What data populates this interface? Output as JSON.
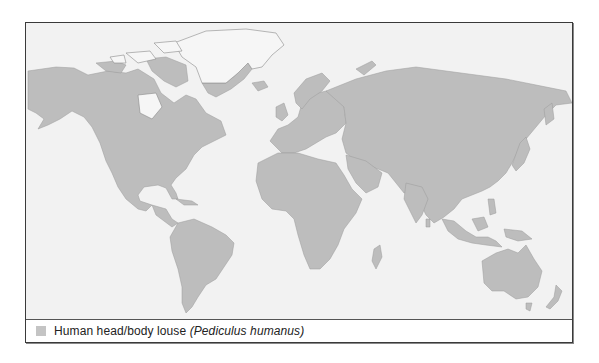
{
  "map": {
    "title": "",
    "colors": {
      "ocean": "#f2f2f2",
      "range": "#bdbdbd",
      "outside_range_land": "#f4f4f4",
      "coastline": "#8a8a8a"
    },
    "regions_shaded": [
      "North America",
      "Central America",
      "South America",
      "Europe",
      "Africa",
      "Asia",
      "Australia",
      "New Zealand",
      "Madagascar",
      "Japan",
      "Southeast Asia",
      "Iceland",
      "British Isles"
    ],
    "regions_unshaded": [
      "Greenland (interior)",
      "Canadian Arctic Archipelago"
    ]
  },
  "legend": {
    "items": [
      {
        "swatch_color": "#c4c4c4",
        "label": "Human head/body louse",
        "scientific_name": "(Pediculus humanus)"
      }
    ]
  }
}
